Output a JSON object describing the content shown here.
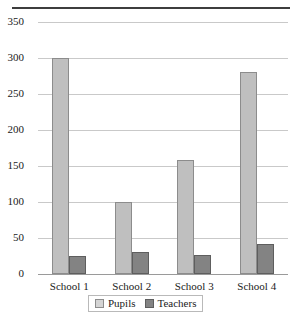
{
  "chart_data": {
    "type": "bar",
    "title": "",
    "xlabel": "",
    "ylabel": "",
    "categories": [
      "School 1",
      "School 2",
      "School 3",
      "School 4"
    ],
    "series": [
      {
        "name": "Pupils",
        "values": [
          300,
          100,
          158,
          280
        ],
        "color": "#bfbfbf"
      },
      {
        "name": "Teachers",
        "values": [
          25,
          30,
          27,
          41
        ],
        "color": "#838383"
      }
    ],
    "ylim": [
      0,
      350
    ],
    "yticks": [
      0,
      50,
      100,
      150,
      200,
      250,
      300,
      350
    ],
    "ytick_labels": [
      "0",
      "50",
      "100",
      "150",
      "200",
      "250",
      "300",
      "350"
    ],
    "grid": "horizontal",
    "legend_position": "bottom-center"
  },
  "legend": {
    "entries": [
      {
        "label": "Pupils"
      },
      {
        "label": "Teachers"
      }
    ]
  },
  "colors": {
    "pupils": "#bfbfbf",
    "teachers": "#838383",
    "gridline": "#c9c9c9",
    "axis": "#9a9a9a",
    "top_rule": "#3d3d3d"
  }
}
